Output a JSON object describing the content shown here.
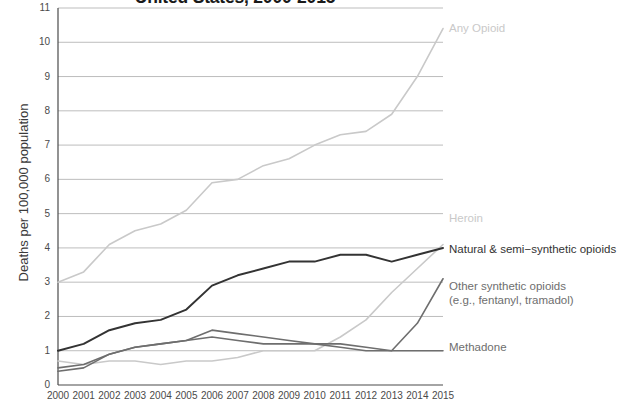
{
  "chart_data": {
    "type": "line",
    "title": "United States, 2000-2015",
    "xlabel": "",
    "ylabel": "Deaths per 100,000 population",
    "x": [
      2000,
      2001,
      2002,
      2003,
      2004,
      2005,
      2006,
      2007,
      2008,
      2009,
      2010,
      2011,
      2012,
      2013,
      2014,
      2015
    ],
    "xtick_labels": [
      "2000",
      "2001",
      "2002",
      "2003",
      "2004",
      "2005",
      "2006",
      "2007",
      "2008",
      "2009",
      "2010",
      "2011",
      "2012",
      "2013",
      "2014",
      "2015"
    ],
    "ytick_labels": [
      "0",
      "1",
      "2",
      "3",
      "4",
      "5",
      "6",
      "7",
      "8",
      "9",
      "10",
      "11"
    ],
    "ylim": [
      0,
      11
    ],
    "xlim": [
      2000,
      2015
    ],
    "grid": "horizontal",
    "legend_position": "right-inline-labels",
    "series": [
      {
        "name": "Any Opioid",
        "color": "#c9c9c9",
        "label_text": "Any Opioid",
        "values": [
          3.0,
          3.3,
          4.1,
          4.5,
          4.7,
          5.1,
          5.9,
          6.0,
          6.4,
          6.6,
          7.0,
          7.3,
          7.4,
          7.9,
          9.0,
          10.4
        ]
      },
      {
        "name": "Heroin",
        "color": "#c9c9c9",
        "label_text": "Heroin",
        "values": [
          0.7,
          0.6,
          0.7,
          0.7,
          0.6,
          0.7,
          0.7,
          0.8,
          1.0,
          1.0,
          1.0,
          1.4,
          1.9,
          2.7,
          3.4,
          4.1
        ]
      },
      {
        "name": "Natural & semi-synthetic opioids",
        "color": "#333333",
        "label_text": "Natural & semi−synthetic opioids",
        "values": [
          1.0,
          1.2,
          1.6,
          1.8,
          1.9,
          2.2,
          2.9,
          3.2,
          3.4,
          3.6,
          3.6,
          3.8,
          3.8,
          3.6,
          3.8,
          4.0
        ]
      },
      {
        "name": "Other synthetic opioids (e.g., fentanyl, tramadol)",
        "color": "#6e6e6e",
        "label_text_line1": "Other synthetic opioids",
        "label_text_line2": "(e.g., fentanyl, tramadol)",
        "values": [
          0.4,
          0.5,
          0.9,
          1.1,
          1.2,
          1.3,
          1.6,
          1.5,
          1.4,
          1.3,
          1.2,
          1.1,
          1.0,
          1.0,
          1.8,
          3.1
        ]
      },
      {
        "name": "Methadone",
        "color": "#6e6e6e",
        "label_text": "Methadone",
        "values": [
          0.5,
          0.6,
          0.9,
          1.1,
          1.2,
          1.3,
          1.4,
          1.3,
          1.2,
          1.2,
          1.2,
          1.2,
          1.1,
          1.0,
          1.0,
          1.0
        ]
      }
    ]
  },
  "axis": {
    "y_title": "Deaths per 100,000 population"
  },
  "labels": {
    "any_opioid": "Any Opioid",
    "heroin": "Heroin",
    "natural": "Natural & semi−synthetic opioids",
    "other_synth_1": "Other synthetic opioids",
    "other_synth_2": "(e.g., fentanyl, tramadol)",
    "methadone": "Methadone"
  },
  "colors": {
    "light_gray": "#c9c9c9",
    "mid_gray": "#8f8f8f",
    "dark_gray": "#6e6e6e",
    "near_black": "#333333",
    "grid": "#b5b5b5",
    "axis": "#4a4a4a"
  }
}
